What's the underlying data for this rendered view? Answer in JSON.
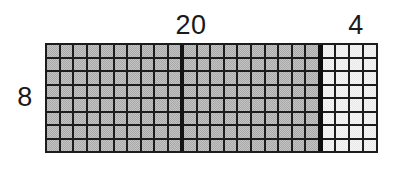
{
  "diagram": {
    "kind": "area-model-grid",
    "background_color": "#ffffff",
    "grid_line_color": "#1c1c1c",
    "rows": 8,
    "total_columns": 24,
    "labels": {
      "top_major": "20",
      "top_minor": "4",
      "left_rows": "8"
    },
    "sections": [
      {
        "name": "major-section",
        "columns": 20,
        "fill_color": "#a9a9a9",
        "shade": "dark",
        "label": "20",
        "subgroups": [
          10,
          10
        ]
      },
      {
        "name": "minor-section",
        "columns": 4,
        "fill_color": "#e9e9e9",
        "shade": "light",
        "label": "4",
        "subgroups": [
          4
        ]
      }
    ]
  },
  "chart_data": {
    "type": "bar",
    "title": "",
    "xlabel": "",
    "ylabel": "",
    "categories": [
      "20",
      "4"
    ],
    "values": [
      20,
      4
    ],
    "series": [
      {
        "name": "columns",
        "values": [
          20,
          4
        ]
      }
    ],
    "rows": 8,
    "cell_counts": [
      160,
      32
    ],
    "total_cells": 192,
    "grid": true,
    "legend": "none"
  }
}
